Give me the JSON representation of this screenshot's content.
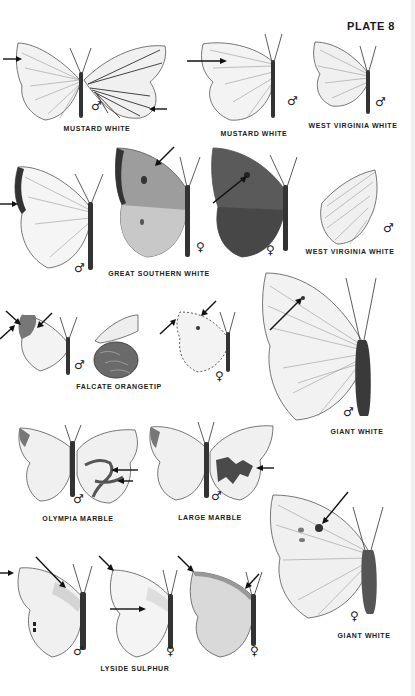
{
  "plate": {
    "title": "PLATE 8"
  },
  "symbols": {
    "male": "♂",
    "female": "♀"
  },
  "colors": {
    "background": "#ffffff",
    "ink": "#222222",
    "arrow": "#111111"
  },
  "figures": [
    {
      "id": "mustard-white-1",
      "label": "MUSTARD WHITE",
      "sex": "male",
      "view": "upper left wing + under right wing",
      "arrows": 2
    },
    {
      "id": "mustard-white-2",
      "label": "MUSTARD WHITE",
      "sex": "male",
      "view": "upper",
      "arrows": 1
    },
    {
      "id": "west-virginia-white-1",
      "label": "WEST VIRGINIA WHITE",
      "sex": "male",
      "view": "upper",
      "arrows": 0
    },
    {
      "id": "great-southern-white-male",
      "label": "GREAT SOUTHERN WHITE",
      "sex": "male",
      "view": "upper",
      "arrows": 1
    },
    {
      "id": "great-southern-white-female-light",
      "label": "GREAT SOUTHERN WHITE",
      "sex": "female",
      "view": "upper",
      "arrows": 1
    },
    {
      "id": "great-southern-white-female-dark",
      "label": "GREAT SOUTHERN WHITE",
      "sex": "female",
      "view": "upper",
      "arrows": 1
    },
    {
      "id": "west-virginia-white-2",
      "label": "WEST VIRGINIA WHITE",
      "sex": "male",
      "view": "under",
      "arrows": 0
    },
    {
      "id": "falcate-orangetip-male",
      "label": "FALCATE ORANGETIP",
      "sex": "male",
      "view": "upper + under hindwing",
      "arrows": 3
    },
    {
      "id": "falcate-orangetip-female",
      "label": "FALCATE ORANGETIP",
      "sex": "female",
      "view": "upper",
      "arrows": 2
    },
    {
      "id": "giant-white-male",
      "label": "GIANT WHITE",
      "sex": "male",
      "view": "upper",
      "arrows": 1
    },
    {
      "id": "olympia-marble",
      "label": "OLYMPIA MARBLE",
      "sex": "male",
      "view": "upper + under",
      "arrows": 2
    },
    {
      "id": "large-marble",
      "label": "LARGE MARBLE",
      "sex": "male",
      "view": "upper + under",
      "arrows": 1
    },
    {
      "id": "giant-white-female",
      "label": "GIANT WHITE",
      "sex": "female",
      "view": "upper",
      "arrows": 1
    },
    {
      "id": "lyside-sulphur-male",
      "label": "LYSIDE SULPHUR",
      "sex": "male",
      "view": "upper",
      "arrows": 2
    },
    {
      "id": "lyside-sulphur-female-1",
      "label": "LYSIDE SULPHUR",
      "sex": "female",
      "view": "upper",
      "arrows": 2
    },
    {
      "id": "lyside-sulphur-female-2",
      "label": "LYSIDE SULPHUR",
      "sex": "female",
      "view": "upper",
      "arrows": 2
    }
  ],
  "captions": [
    {
      "text": "MUSTARD WHITE",
      "x": 97,
      "y": 127
    },
    {
      "text": "MUSTARD WHITE",
      "x": 254,
      "y": 132
    },
    {
      "text": "WEST VIRGINIA WHITE",
      "x": 353,
      "y": 124
    },
    {
      "text": "WEST VIRGINIA WHITE",
      "x": 350,
      "y": 250
    },
    {
      "text": "GREAT SOUTHERN WHITE",
      "x": 159,
      "y": 272
    },
    {
      "text": "FALCATE ORANGETIP",
      "x": 119,
      "y": 385
    },
    {
      "text": "GIANT WHITE",
      "x": 357,
      "y": 430
    },
    {
      "text": "OLYMPIA MARBLE",
      "x": 78,
      "y": 517
    },
    {
      "text": "LARGE MARBLE",
      "x": 210,
      "y": 516
    },
    {
      "text": "GIANT WHITE",
      "x": 364,
      "y": 634
    },
    {
      "text": "LYSIDE SULPHUR",
      "x": 135,
      "y": 667
    }
  ]
}
